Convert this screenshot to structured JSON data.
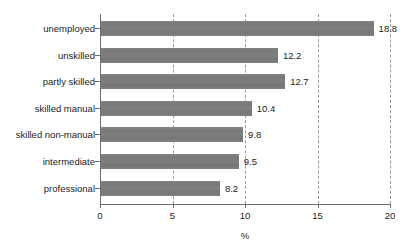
{
  "chart_data": {
    "type": "bar",
    "orientation": "horizontal",
    "title": "",
    "xlabel": "%",
    "ylabel": "",
    "xlim": [
      0,
      20
    ],
    "xticks": [
      "0",
      "5",
      "10",
      "15",
      "20"
    ],
    "grid": "vertical dashed at x ticks",
    "legend": "none",
    "bar_color": "#7b7b7b",
    "categories": [
      "unemployed",
      "unskilled",
      "partly skilled",
      "skilled manual",
      "skilled non-manual",
      "intermediate",
      "professional"
    ],
    "values": [
      18.8,
      12.2,
      12.7,
      10.4,
      9.8,
      9.5,
      8.2
    ],
    "value_labels": [
      "18.8",
      "12.2",
      "12.7",
      "10.4",
      "9.8",
      "9.5",
      "8.2"
    ]
  }
}
